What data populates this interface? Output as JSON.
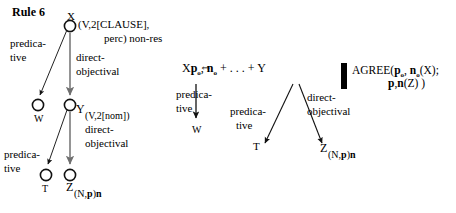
{
  "title": "Rule 6",
  "equivalence_symbol": "⇔",
  "left_tree": {
    "nodes": [
      {
        "id": "X",
        "letter": "X",
        "subscript": "(V,2[CLAUSE],",
        "subscript_line2": "perc) non-res"
      },
      {
        "id": "W",
        "letter": "W",
        "subscript": ""
      },
      {
        "id": "Y",
        "letter": "Y",
        "subscript": "(V,2[nom])"
      },
      {
        "id": "T",
        "letter": "T",
        "subscript": ""
      },
      {
        "id": "Z",
        "letter": "Z",
        "subscript": "(N,p)n"
      }
    ],
    "edge_labels": [
      {
        "id": "x-w",
        "line1": "predica-",
        "line2": "tive"
      },
      {
        "id": "x-y",
        "line1": "direct-",
        "line2": "objectival"
      },
      {
        "id": "y-t",
        "line1": "predica-",
        "line2": "tive"
      },
      {
        "id": "y-z",
        "line1": "direct-",
        "line2": "objectival"
      }
    ]
  },
  "right_tree": {
    "expression": {
      "x_letter": "X",
      "x_feat_p": "p",
      "x_feat_p_sub": "o",
      "x_comma": ", ",
      "x_feat_n": "n",
      "x_feat_n_sub": "o",
      "plus_dots": " + . . . + ",
      "y_letter": "Y"
    },
    "nodes": [
      {
        "id": "W",
        "letter": "W"
      },
      {
        "id": "T",
        "letter": "T"
      },
      {
        "id": "Z",
        "letter": "Z",
        "subscript": "(N,p)n"
      }
    ],
    "edge_labels": [
      {
        "id": "x-w",
        "line1": "predica-",
        "line2": "tive"
      },
      {
        "id": "y-t",
        "line1": "predica-",
        "line2": "tive"
      },
      {
        "id": "y-z",
        "line1": "direct-",
        "line2": "objectival"
      }
    ]
  },
  "agree_block": {
    "line1_prefix": "AGREE(",
    "line1_p": "p",
    "line1_p_sub": "o",
    "line1_comma": ", ",
    "line1_n": "n",
    "line1_n_sub": "o",
    "line1_suffix": "(X);",
    "line2_p": "p",
    "line2_comma": ",",
    "line2_n": "n",
    "line2_suffix": "(Z) )"
  },
  "colors": {
    "ink": "#000000",
    "background": "#ffffff",
    "arrow_gray": "#808080"
  }
}
